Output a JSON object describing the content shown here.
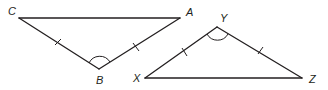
{
  "diagram": {
    "type": "congruent-triangles",
    "colors": {
      "stroke": "#231f20",
      "background": "#ffffff"
    },
    "triangles": [
      {
        "name": "triangle-CBA",
        "vertices": {
          "C": {
            "label": "C",
            "x": 19,
            "y": 18
          },
          "A": {
            "label": "A",
            "x": 180,
            "y": 18
          },
          "B": {
            "label": "B",
            "x": 99,
            "y": 69
          }
        },
        "congruent_sides": [
          "CB",
          "BA"
        ],
        "marked_angle": "B"
      },
      {
        "name": "triangle-XYZ",
        "vertices": {
          "X": {
            "label": "X",
            "x": 145,
            "y": 78
          },
          "Y": {
            "label": "Y",
            "x": 217,
            "y": 27
          },
          "Z": {
            "label": "Z",
            "x": 302,
            "y": 78
          }
        },
        "congruent_sides": [
          "XY",
          "YZ"
        ],
        "marked_angle": "Y"
      }
    ],
    "labels": {
      "C": "C",
      "A": "A",
      "B": "B",
      "X": "X",
      "Y": "Y",
      "Z": "Z"
    }
  }
}
